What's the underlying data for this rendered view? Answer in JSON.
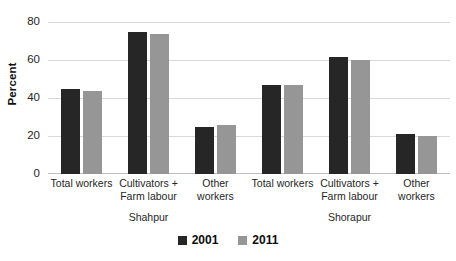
{
  "chart_data": {
    "type": "bar",
    "title": "",
    "subtitle": "",
    "xlabel": "",
    "ylabel": "Percent",
    "ylim": [
      0,
      80
    ],
    "yticks": [
      0,
      20,
      40,
      60,
      80
    ],
    "ytick_labels": [
      "0",
      "20",
      "40",
      "60",
      "80"
    ],
    "grid": true,
    "grid_axis": "y",
    "legend_position": "bottom-center",
    "categories": [
      "Total workers",
      "Cultivators + Farm labour",
      "Other workers",
      "Total workers",
      "Cultivators + Farm labour",
      "Other workers"
    ],
    "category_lines": [
      [
        "Total workers"
      ],
      [
        "Cultivators +",
        "Farm labour"
      ],
      [
        "Other workers"
      ],
      [
        "Total workers"
      ],
      [
        "Cultivators +",
        "Farm labour"
      ],
      [
        "Other workers"
      ]
    ],
    "panels": [
      {
        "label": "Shahpur",
        "category_span": 3
      },
      {
        "label": "Shorapur",
        "category_span": 3
      }
    ],
    "series": [
      {
        "name": "2001",
        "color": "#262626",
        "values": [
          45,
          75,
          25,
          47,
          61.5,
          21
        ]
      },
      {
        "name": "2011",
        "color": "#969696",
        "values": [
          43.5,
          73.5,
          26,
          47,
          60,
          20
        ]
      }
    ],
    "colors": {
      "series_2001": "#262626",
      "series_2011": "#969696",
      "gridline": "#d9d9d9",
      "text": "#262626",
      "background": "#ffffff"
    }
  },
  "legend": {
    "items": [
      {
        "label": "2001",
        "color": "#262626"
      },
      {
        "label": "2011",
        "color": "#969696"
      }
    ]
  }
}
